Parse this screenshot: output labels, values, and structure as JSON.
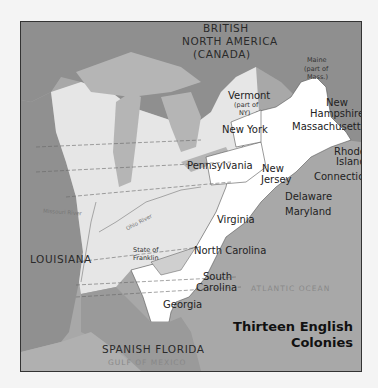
{
  "map": {
    "title_line1": "Thirteen English",
    "title_line2": "Colonies",
    "regions": {
      "british_na_1": "BRITISH",
      "british_na_2": "NORTH AMERICA",
      "british_na_3": "(CANADA)",
      "louisiana": "LOUISIANA",
      "spanish_florida": "SPANISH FLORIDA"
    },
    "water": {
      "atlantic": "ATLANTIC OCEAN",
      "gulf": "GULF OF MEXICO"
    },
    "rivers": {
      "ohio": "Ohio River",
      "missouri": "Missouri River"
    },
    "colonies": {
      "maine_1": "Maine",
      "maine_2": "(part of",
      "maine_3": "Mass.)",
      "vermont": "Vermont",
      "vermont_note_1": "(part of",
      "vermont_note_2": "NY)",
      "new_hampshire_1": "New",
      "new_hampshire_2": "Hampshire",
      "massachusetts": "Massachusetts",
      "new_york": "New York",
      "rhode_island_1": "Rhode",
      "rhode_island_2": "Island",
      "connecticut": "Connecticut",
      "pennsylvania": "Pennsylvania",
      "new_jersey_1": "New",
      "new_jersey_2": "Jersey",
      "delaware": "Delaware",
      "maryland": "Maryland",
      "virginia": "Virginia",
      "north_carolina": "North Carolina",
      "south_carolina_1": "South",
      "south_carolina_2": "Carolina",
      "georgia": "Georgia",
      "franklin_1": "State of",
      "franklin_2": "Franklin"
    },
    "colors": {
      "ocean": "#a8a8a8",
      "canada": "#8f8f8f",
      "louisiana": "#909090",
      "western_lands": "#e6e6e6",
      "colonies": "#ffffff",
      "lakes": "#b5b5b5",
      "spanish_florida": "#9a9a9a"
    }
  }
}
